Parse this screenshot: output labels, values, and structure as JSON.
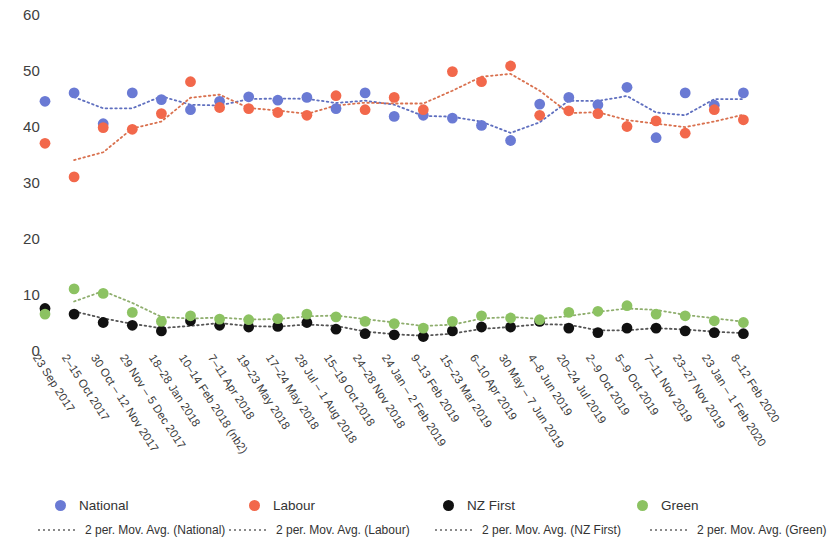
{
  "chart_data": {
    "type": "scatter",
    "title": "",
    "xlabel": "",
    "ylabel": "",
    "ylim": [
      0,
      60
    ],
    "y_ticks": [
      0,
      10,
      20,
      30,
      40,
      50,
      60
    ],
    "grid": false,
    "legend_position": "bottom",
    "categories": [
      "23 Sep 2017",
      "2–15 Oct 2017",
      "30 Oct – 12 Nov 2017",
      "29 Nov – 5 Dec 2017",
      "18–28 Jan 2018",
      "10–14 Feb 2018 (nb2)",
      "7–11 Apr 2018",
      "19–23 May 2018",
      "17–24 May 2018",
      "28 Jul – 1 Aug 2018",
      "15–19 Oct 2018",
      "24–28 Nov 2018",
      "24 Jan – 2 Feb 2019",
      "9–13 Feb 2019",
      "15–23 Mar 2019",
      "6–10 Apr 2019",
      "30 May – 7 Jun 2019",
      "4–8 Jun 2019",
      "20–24 Jul 2019",
      "2–9 Oct 2019",
      "5–9 Oct 2019",
      "7–11 Nov 2019",
      "23–27 Nov 2019",
      "23 Jan – 1 Feb 2020",
      "8–12 Feb 2020"
    ],
    "series": [
      {
        "name": "National",
        "color": "#6a7ad4",
        "values": [
          44.5,
          46.0,
          40.5,
          46.0,
          44.8,
          43.0,
          44.5,
          45.3,
          44.7,
          45.2,
          43.2,
          46.0,
          41.8,
          42.0,
          41.5,
          40.2,
          37.5,
          44.0,
          45.2,
          43.9,
          47.0,
          38.0,
          46.0,
          43.8,
          46.0
        ]
      },
      {
        "name": "Labour",
        "color": "#f2684b",
        "values": [
          37.0,
          31.0,
          39.8,
          39.5,
          42.3,
          48.0,
          43.4,
          43.2,
          42.5,
          42.0,
          45.5,
          43.0,
          45.2,
          43.0,
          49.8,
          48.0,
          50.8,
          42.0,
          42.8,
          42.3,
          40.0,
          41.0,
          38.8,
          43.0,
          41.2
        ]
      },
      {
        "name": "NZ First",
        "color": "#111111",
        "values": [
          7.5,
          6.5,
          5.0,
          4.5,
          3.5,
          5.3,
          4.5,
          4.2,
          4.3,
          5.0,
          3.8,
          3.0,
          2.8,
          2.5,
          3.5,
          4.2,
          4.2,
          5.2,
          4.0,
          3.2,
          4.0,
          4.0,
          3.5,
          3.2,
          3.0
        ]
      },
      {
        "name": "Green",
        "color": "#8cc262",
        "values": [
          6.5,
          11.0,
          10.2,
          6.8,
          5.2,
          6.2,
          5.6,
          5.5,
          5.7,
          6.5,
          6.0,
          5.2,
          4.8,
          4.0,
          5.2,
          6.2,
          5.8,
          5.5,
          6.8,
          7.0,
          8.0,
          6.5,
          6.2,
          5.3,
          5.0
        ]
      }
    ],
    "trend_series": [
      {
        "name": "2 per. Mov. Avg. (National)",
        "color": "#5f6fbf"
      },
      {
        "name": "2 per. Mov. Avg. (Labour)",
        "color": "#d9714f"
      },
      {
        "name": "2 per. Mov. Avg. (NZ First)",
        "color": "#555555"
      },
      {
        "name": "2 per. Mov. Avg. (Green)",
        "color": "#8fae6e"
      }
    ]
  },
  "legend": {
    "markers": [
      {
        "label": "National",
        "color": "#6a7ad4"
      },
      {
        "label": "Labour",
        "color": "#f2684b"
      },
      {
        "label": "NZ First",
        "color": "#111111"
      },
      {
        "label": "Green",
        "color": "#8cc262"
      }
    ],
    "trends": [
      {
        "label": "2 per. Mov. Avg. (National)"
      },
      {
        "label": "2 per. Mov. Avg. (Labour)"
      },
      {
        "label": "2 per. Mov. Avg. (NZ First)"
      },
      {
        "label": "2 per. Mov. Avg. (Green)"
      }
    ]
  }
}
